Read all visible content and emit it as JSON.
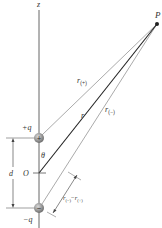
{
  "diagram": {
    "axis_label": "z",
    "point_label": "P",
    "origin_label": "O",
    "angle_label": "θ",
    "separation_label": "d",
    "positive_charge": {
      "label": "+q",
      "symbol": "+"
    },
    "negative_charge": {
      "label": "−q",
      "symbol": "−"
    },
    "r_label": "r",
    "r_plus_label": "r",
    "r_plus_sub": "(+)",
    "r_minus_label": "r",
    "r_minus_sub": "(−)",
    "diff_label_r1": "r",
    "diff_sub1": "(−)",
    "diff_minus": "−",
    "diff_label_r2": "r",
    "diff_sub2": "(+)"
  },
  "colors": {
    "axis": "#555555",
    "r_line": "#222222",
    "aux_lines": "#9a9a9a",
    "charge_fill": "#8c8c8c"
  }
}
